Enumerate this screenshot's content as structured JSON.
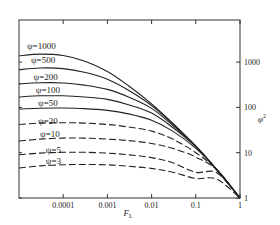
{
  "chart_data": {
    "type": "line",
    "title": "",
    "xlabel": "F_L",
    "ylabel": "φ²",
    "x_scale": "log",
    "y_scale": "log",
    "xlim": [
      1e-05,
      1
    ],
    "ylim": [
      1,
      8500
    ],
    "x_ticks": [
      {
        "value": 0.0001,
        "label": "0.0001"
      },
      {
        "value": 0.001,
        "label": "0.001"
      },
      {
        "value": 0.01,
        "label": "0.01"
      },
      {
        "value": 0.1,
        "label": "0.1"
      },
      {
        "value": 1,
        "label": "1"
      }
    ],
    "y_ticks": [
      {
        "value": 1000,
        "label": "1000"
      },
      {
        "value": 100,
        "label": "100"
      },
      {
        "value": 10,
        "label": "10"
      },
      {
        "value": 1,
        "label": "1"
      }
    ],
    "y_axis_position": "right",
    "grid": false,
    "legend": "inline curve labels",
    "series": [
      {
        "name": "ψ=1000",
        "style": "solid",
        "label_at": [
          3.2e-05,
          1900
        ],
        "x": [
          1e-05,
          3e-05,
          0.0001,
          0.0003,
          0.001,
          0.003,
          0.01,
          0.03,
          0.1,
          0.3,
          1
        ],
        "y": [
          1380,
          1500,
          1400,
          1050,
          620,
          300,
          120,
          45,
          14,
          4.2,
          1
        ]
      },
      {
        "name": "ψ=500",
        "style": "solid",
        "label_at": [
          3.5e-05,
          960
        ],
        "x": [
          1e-05,
          3e-05,
          0.0001,
          0.0003,
          0.001,
          0.003,
          0.01,
          0.03,
          0.1,
          0.3,
          1
        ],
        "y": [
          680,
          740,
          720,
          600,
          420,
          240,
          110,
          43,
          14,
          4.2,
          1
        ]
      },
      {
        "name": "ψ=200",
        "style": "solid",
        "label_at": [
          4e-05,
          410
        ],
        "x": [
          1e-05,
          3e-05,
          0.0001,
          0.0003,
          0.001,
          0.003,
          0.01,
          0.03,
          0.1,
          0.3,
          1
        ],
        "y": [
          330,
          350,
          345,
          310,
          250,
          170,
          95,
          40,
          14,
          4.2,
          1
        ]
      },
      {
        "name": "ψ=100",
        "style": "solid",
        "label_at": [
          4.5e-05,
          210
        ],
        "x": [
          1e-05,
          3e-05,
          0.0001,
          0.0003,
          0.001,
          0.003,
          0.01,
          0.03,
          0.1,
          0.3,
          1
        ],
        "y": [
          170,
          180,
          180,
          170,
          150,
          115,
          75,
          36,
          13.5,
          4.2,
          1
        ]
      },
      {
        "name": "ψ=50",
        "style": "solid",
        "label_at": [
          4.5e-05,
          105
        ],
        "x": [
          1e-05,
          3e-05,
          0.0001,
          0.0003,
          0.001,
          0.003,
          0.01,
          0.03,
          0.1,
          0.3,
          1
        ],
        "y": [
          92,
          96,
          97,
          94,
          86,
          72,
          52,
          30,
          12.5,
          4.2,
          1
        ]
      },
      {
        "name": "ψ=20",
        "style": "dashed",
        "label_at": [
          4.5e-05,
          42
        ],
        "x": [
          1e-05,
          3e-05,
          0.0001,
          0.0003,
          0.001,
          0.003,
          0.01,
          0.03,
          0.1,
          0.3,
          1
        ],
        "y": [
          42,
          45,
          46,
          45,
          42,
          37,
          30,
          20,
          10,
          4.2,
          1
        ]
      },
      {
        "name": "ψ=10",
        "style": "dashed",
        "label_at": [
          5e-05,
          22
        ],
        "x": [
          1e-05,
          3e-05,
          0.0001,
          0.0003,
          0.001,
          0.003,
          0.01,
          0.03,
          0.1,
          0.3,
          1
        ],
        "y": [
          18,
          20,
          21,
          21,
          20,
          18.5,
          16,
          12.5,
          8,
          4.2,
          1
        ]
      },
      {
        "name": "ψ=5",
        "style": "dashed",
        "label_at": [
          6e-05,
          10
        ],
        "x": [
          1e-05,
          3e-05,
          0.0001,
          0.0003,
          0.001,
          0.003,
          0.01,
          0.03,
          0.1,
          0.3,
          1
        ],
        "y": [
          9.0,
          9.8,
          10.2,
          10.2,
          9.8,
          9.0,
          7.8,
          6.0,
          3.7,
          3.6,
          1
        ]
      },
      {
        "name": "ψ=3",
        "style": "dashed",
        "label_at": [
          6e-05,
          5.6
        ],
        "x": [
          1e-05,
          3e-05,
          0.0001,
          0.0003,
          0.001,
          0.003,
          0.01,
          0.03,
          0.1,
          0.3,
          1
        ],
        "y": [
          4.6,
          5.1,
          5.4,
          5.5,
          5.4,
          5.0,
          4.5,
          3.7,
          2.7,
          2.6,
          1
        ]
      }
    ]
  }
}
